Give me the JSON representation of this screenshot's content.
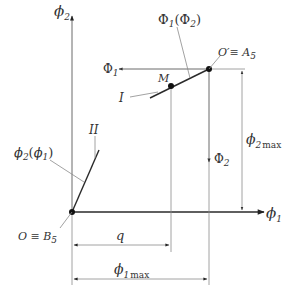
{
  "diagram": {
    "axes": {
      "vertical": {
        "symbol": "ϕ",
        "sub": "2"
      },
      "horizontal": {
        "symbol": "ϕ",
        "sub": "1"
      }
    },
    "characteristics": {
      "curve_I": {
        "label": "I",
        "function": {
          "main": "Φ",
          "main_sub": "1",
          "arg": "Φ",
          "arg_sub": "2"
        }
      },
      "curve_II": {
        "label": "II",
        "function": {
          "main": "ϕ",
          "main_sub": "2",
          "arg": "ϕ",
          "arg_sub": "1"
        }
      }
    },
    "points": {
      "origin": {
        "text": "O ≡ B",
        "sub": "5"
      },
      "o_prime": {
        "text": "O′≡ A",
        "sub": "5"
      },
      "m": {
        "text": "M"
      }
    },
    "secondary_axes": {
      "phi1_capital": {
        "symbol": "Φ",
        "sub": "1"
      },
      "phi2_capital": {
        "symbol": "Φ",
        "sub": "2"
      }
    },
    "dimensions": {
      "q": {
        "text": "q"
      },
      "phi1_max": {
        "symbol": "ϕ",
        "sub": "1",
        "suffix": "max"
      },
      "phi2_max": {
        "symbol": "ϕ",
        "sub": "2",
        "suffix": "max"
      }
    }
  }
}
